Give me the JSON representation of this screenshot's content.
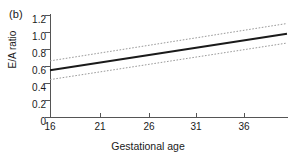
{
  "chart_data": {
    "type": "line",
    "title": "",
    "panel_label": "(b)",
    "xlabel": "Gestational age",
    "ylabel": "E/A ratio",
    "xlim": [
      16,
      40
    ],
    "ylim": [
      0,
      1.2
    ],
    "xticks": [
      16,
      21,
      26,
      31,
      36
    ],
    "xtick_labels": [
      "16",
      "21",
      "26",
      "31",
      "36"
    ],
    "yticks": [
      0,
      0.2,
      0.4,
      0.6,
      0.8,
      1.0,
      1.2
    ],
    "ytick_labels": [
      "0",
      "0.2",
      "0.4",
      "0.6",
      "0.8",
      "1.0",
      "1.2"
    ],
    "grid": false,
    "legend": null,
    "x": [
      16,
      40
    ],
    "series": [
      {
        "name": "upper confidence limit",
        "style": "dotted",
        "color": "#9a9a9a",
        "values": [
          0.66,
          1.1
        ]
      },
      {
        "name": "fitted regression line",
        "style": "solid",
        "color": "#1a1a1a",
        "values": [
          0.55,
          0.98
        ]
      },
      {
        "name": "lower confidence limit",
        "style": "dotted",
        "color": "#9a9a9a",
        "values": [
          0.44,
          0.87
        ]
      }
    ]
  },
  "colors": {
    "axis": "#555555",
    "line": "#1a1a1a",
    "band": "#9a9a9a",
    "text": "#1a1a1a",
    "background": "#ffffff"
  }
}
